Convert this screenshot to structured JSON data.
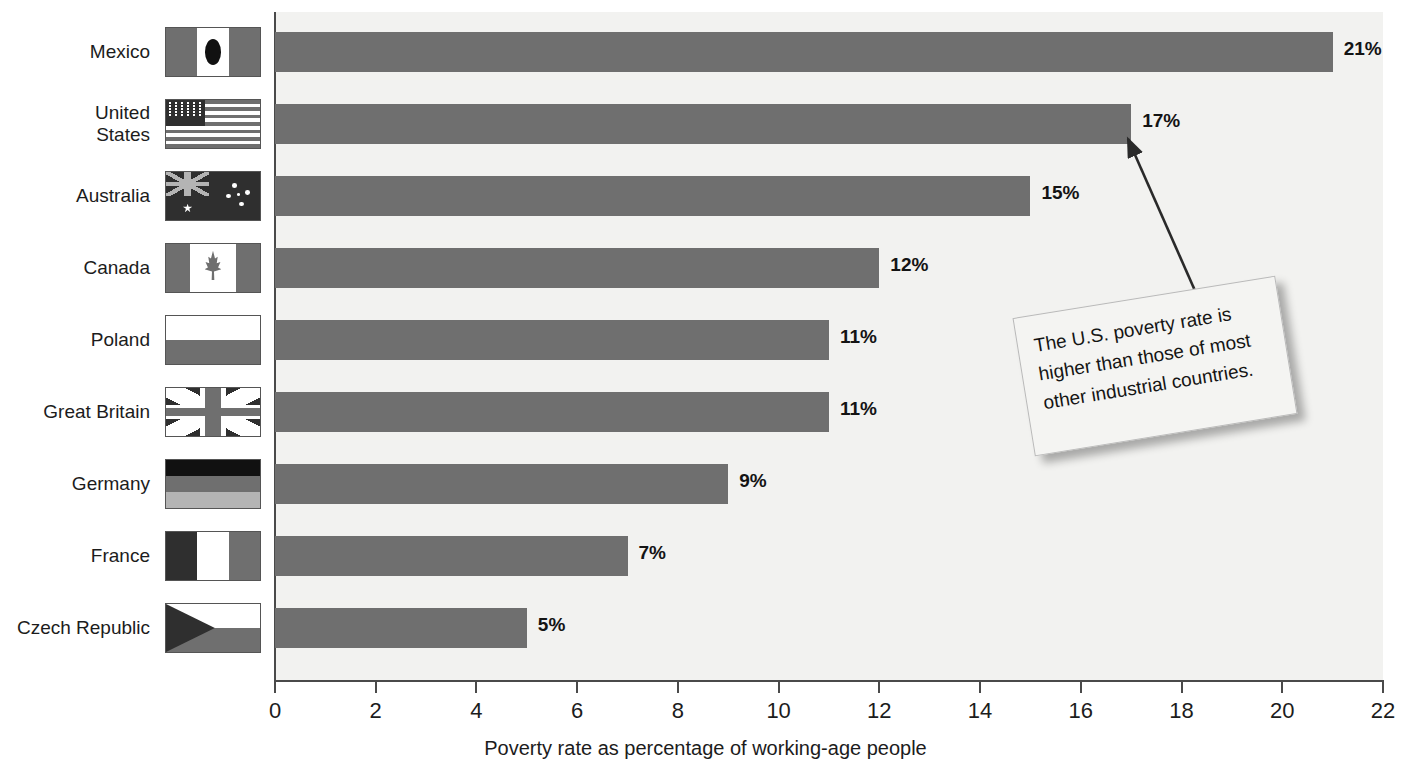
{
  "chart_data": {
    "type": "bar",
    "orientation": "horizontal",
    "title": "",
    "xlabel": "Poverty rate as percentage of working-age people",
    "ylabel": "",
    "xlim": [
      0,
      22
    ],
    "xticks": [
      0,
      2,
      4,
      6,
      8,
      10,
      12,
      14,
      16,
      18,
      20,
      22
    ],
    "grid": false,
    "legend": "none",
    "value_suffix": "%",
    "categories": [
      "Mexico",
      "United States",
      "Australia",
      "Canada",
      "Poland",
      "Great Britain",
      "Germany",
      "France",
      "Czech Republic"
    ],
    "values": [
      21,
      17,
      15,
      12,
      11,
      11,
      9,
      7,
      5
    ],
    "value_labels": [
      "21%",
      "17%",
      "15%",
      "12%",
      "11%",
      "11%",
      "9%",
      "7%",
      "5%"
    ],
    "annotations": [
      {
        "text": "The U.S. poverty rate is higher than those of most other industrial countries.",
        "points_to": "United States"
      }
    ]
  },
  "rows": [
    {
      "label": "Mexico",
      "label_display": "Mexico",
      "value": 21,
      "value_label": "21%",
      "flag": "flag-mexico"
    },
    {
      "label": "United States",
      "label_display": "United\nStates",
      "value": 17,
      "value_label": "17%",
      "flag": "flag-united-states"
    },
    {
      "label": "Australia",
      "label_display": "Australia",
      "value": 15,
      "value_label": "15%",
      "flag": "flag-australia"
    },
    {
      "label": "Canada",
      "label_display": "Canada",
      "value": 12,
      "value_label": "12%",
      "flag": "flag-canada"
    },
    {
      "label": "Poland",
      "label_display": "Poland",
      "value": 11,
      "value_label": "11%",
      "flag": "flag-poland"
    },
    {
      "label": "Great Britain",
      "label_display": "Great Britain",
      "value": 11,
      "value_label": "11%",
      "flag": "flag-great-britain"
    },
    {
      "label": "Germany",
      "label_display": "Germany",
      "value": 9,
      "value_label": "9%",
      "flag": "flag-germany"
    },
    {
      "label": "France",
      "label_display": "France",
      "value": 7,
      "value_label": "7%",
      "flag": "flag-france"
    },
    {
      "label": "Czech Republic",
      "label_display": "Czech Republic",
      "value": 5,
      "value_label": "5%",
      "flag": "flag-czech-republic"
    }
  ],
  "axis": {
    "tick_labels": [
      "0",
      "2",
      "4",
      "6",
      "8",
      "10",
      "12",
      "14",
      "16",
      "18",
      "20",
      "22"
    ],
    "title": "Poverty rate as percentage of working-age people"
  },
  "callout": {
    "text": "The U.S. poverty rate is higher than those of most other industrial countries."
  },
  "colors": {
    "bar": "#6f6f6f",
    "plot_background": "#f2f2f0",
    "axis": "#4a4a4a",
    "text": "#1c1c1c",
    "callout_background": "#f4f4f2"
  }
}
